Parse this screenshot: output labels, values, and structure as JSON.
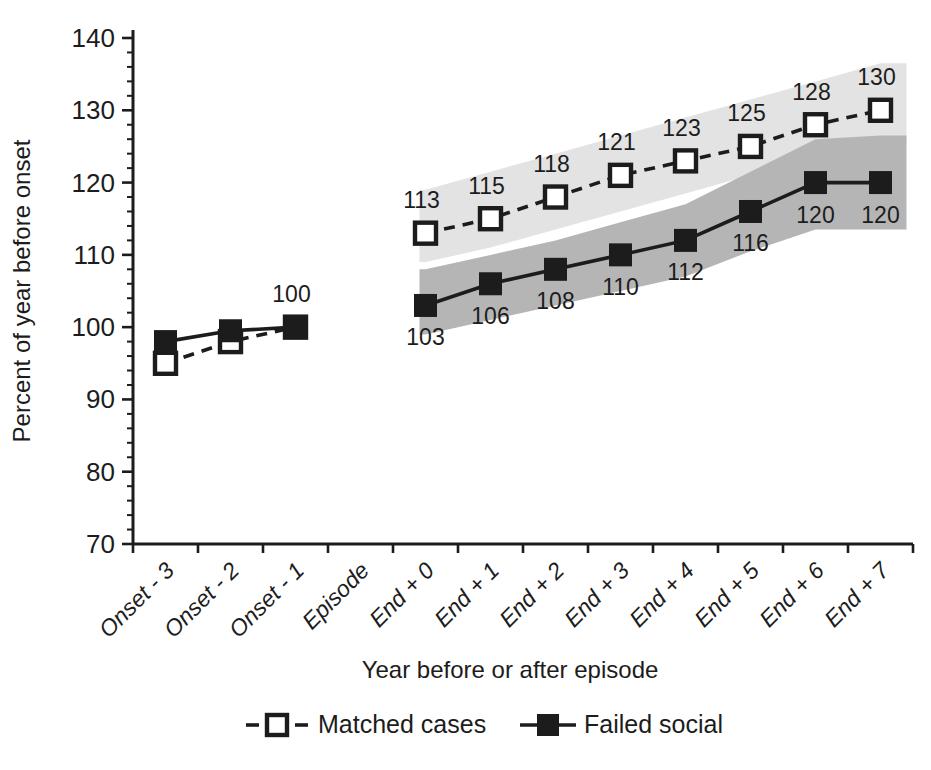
{
  "figure": {
    "background": "#ffffff",
    "ink": "#1c1c1c"
  },
  "chart_data": {
    "type": "line",
    "title": "",
    "xlabel": "Year before or after episode",
    "ylabel": "Percent of year before onset",
    "ylim": [
      70,
      140
    ],
    "y_ticks": [
      "70",
      "80",
      "90",
      "100",
      "110",
      "120",
      "130",
      "140"
    ],
    "y_minor_step": 2,
    "grid": "off",
    "legend_position": "bottom",
    "categories": [
      "Onset - 3",
      "Onset - 2",
      "Onset - 1",
      "Episode",
      "End + 0",
      "End + 1",
      "End + 2",
      "End + 3",
      "End + 4",
      "End + 5",
      "End + 6",
      "End + 7"
    ],
    "series": [
      {
        "name": "Matched cases",
        "line": "dashed",
        "marker": "open-square",
        "segments": [
          {
            "start_index": 0,
            "values": [
              95,
              98,
              100
            ],
            "labels": [
              null,
              null,
              null
            ],
            "label_side": "above"
          },
          {
            "start_index": 4,
            "values": [
              113,
              115,
              118,
              121,
              123,
              125,
              128,
              130
            ],
            "labels": [
              "113",
              "115",
              "118",
              "121",
              "123",
              "125",
              "128",
              "130"
            ],
            "label_side": "above"
          }
        ]
      },
      {
        "name": "Failed social",
        "line": "solid",
        "marker": "filled-square",
        "segments": [
          {
            "start_index": 0,
            "values": [
              98,
              99.5,
              100
            ],
            "labels": [
              null,
              null,
              "100"
            ],
            "label_side": "above"
          },
          {
            "start_index": 4,
            "values": [
              103,
              106,
              108,
              110,
              112,
              116,
              120,
              120
            ],
            "labels": [
              "103",
              "106",
              "108",
              "110",
              "112",
              "116",
              "120",
              "120"
            ],
            "label_side": "below"
          }
        ]
      }
    ],
    "bands": [
      {
        "name": "matched-cases-confidence-band",
        "color": "#e3e3e3",
        "start_index": 4,
        "upper": [
          119,
          121.5,
          124,
          126.5,
          129,
          131.5,
          134,
          136.5
        ],
        "lower": [
          109,
          111,
          113.5,
          116,
          118.5,
          121,
          123.5,
          125.5
        ]
      },
      {
        "name": "failed-social-confidence-band",
        "color": "#b5b5b5",
        "start_index": 4,
        "upper": [
          108,
          110,
          112,
          114.5,
          117,
          121.5,
          126,
          126.5
        ],
        "lower": [
          99,
          101,
          103,
          105,
          107,
          110.5,
          113.5,
          113.5
        ]
      }
    ],
    "legend": {
      "items": [
        {
          "label": "Matched cases",
          "line": "dashed",
          "marker": "open-square"
        },
        {
          "label": "Failed social",
          "line": "solid",
          "marker": "filled-square"
        }
      ]
    }
  }
}
